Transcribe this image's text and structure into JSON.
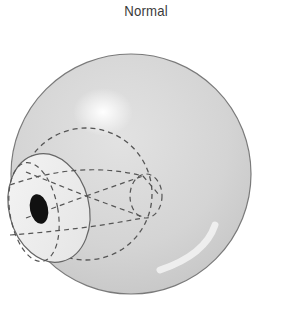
{
  "figure": {
    "title": "Normal",
    "colors": {
      "sphere_fill": "#d6d6d6",
      "sphere_stroke": "#7a7a7a",
      "highlight": "#ffffff",
      "cornea_fill": "#ececec",
      "dash_stroke": "#555555",
      "pupil": "#111111"
    },
    "elements": [
      "outer-sphere",
      "eyeball-dashed-circle",
      "cornea",
      "pupil",
      "focal-lines",
      "retina-dashed-ellipse"
    ]
  }
}
